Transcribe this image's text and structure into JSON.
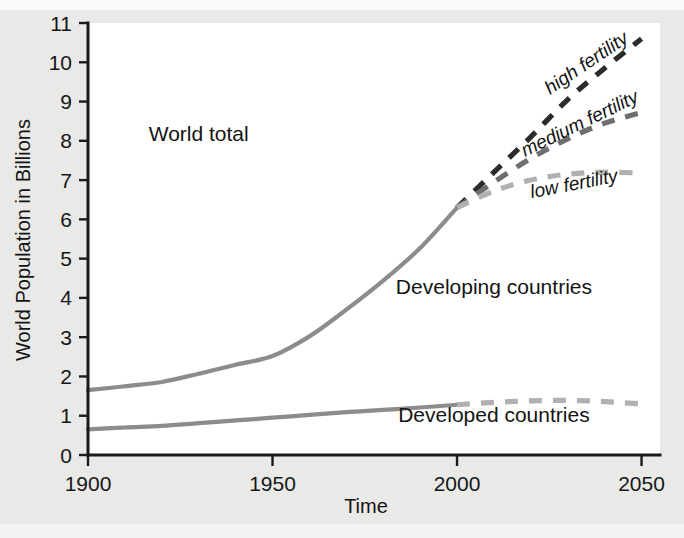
{
  "chart_data": {
    "type": "line",
    "title": "",
    "xlabel": "Time",
    "ylabel": "World Population in Billions",
    "xlim": [
      1900,
      2055
    ],
    "ylim": [
      0,
      11
    ],
    "xticks": [
      1900,
      1950,
      2000,
      2050
    ],
    "xtick_labels": [
      "1900",
      "1950",
      "2000",
      "2050"
    ],
    "yticks": [
      0,
      1,
      2,
      3,
      4,
      5,
      6,
      7,
      8,
      9,
      10,
      11
    ],
    "ytick_labels": [
      "0",
      "1",
      "2",
      "3",
      "4",
      "5",
      "6",
      "7",
      "8",
      "9",
      "10",
      "11"
    ],
    "grid": false,
    "legend_position": "inline-annotations",
    "colors": {
      "world_total": "#8c8c8c",
      "developed": "#8c8c8c",
      "high_fertility": "#2b2b2b",
      "medium_fertility": "#6e6e6e",
      "low_fertility": "#b0b0b0",
      "axis": "#1a1a1a",
      "plot_background": "#ffffff",
      "page_background": "#e9e9e7"
    },
    "series": [
      {
        "name": "World total",
        "style": "solid",
        "color": "#8c8c8c",
        "x": [
          1900,
          1910,
          1920,
          1930,
          1940,
          1950,
          1960,
          1970,
          1980,
          1990,
          2000
        ],
        "values": [
          1.65,
          1.75,
          1.86,
          2.07,
          2.3,
          2.52,
          3.02,
          3.7,
          4.44,
          5.27,
          6.3
        ]
      },
      {
        "name": "Developed countries",
        "style": "solid",
        "color": "#8c8c8c",
        "x": [
          1900,
          1910,
          1920,
          1930,
          1940,
          1950,
          1960,
          1970,
          1980,
          1990,
          2000
        ],
        "values": [
          0.65,
          0.7,
          0.74,
          0.81,
          0.88,
          0.95,
          1.02,
          1.09,
          1.15,
          1.21,
          1.28
        ]
      },
      {
        "name": "high fertility",
        "style": "dashed",
        "color": "#2b2b2b",
        "x": [
          2000,
          2010,
          2020,
          2030,
          2040,
          2050
        ],
        "values": [
          6.3,
          7.2,
          8.1,
          9.05,
          9.85,
          10.6
        ]
      },
      {
        "name": "medium fertility",
        "style": "dashed",
        "color": "#6e6e6e",
        "x": [
          2000,
          2010,
          2020,
          2030,
          2040,
          2050
        ],
        "values": [
          6.3,
          6.95,
          7.55,
          8.05,
          8.45,
          8.72
        ]
      },
      {
        "name": "low fertility",
        "style": "dashed",
        "color": "#b0b0b0",
        "x": [
          2000,
          2010,
          2020,
          2030,
          2040,
          2050
        ],
        "values": [
          6.3,
          6.72,
          7.0,
          7.15,
          7.2,
          7.18
        ]
      },
      {
        "name": "Developed countries projection",
        "style": "dashed",
        "color": "#b0b0b0",
        "x": [
          2000,
          2010,
          2020,
          2030,
          2040,
          2050
        ],
        "values": [
          1.28,
          1.34,
          1.38,
          1.39,
          1.36,
          1.3
        ]
      }
    ],
    "annotations": [
      {
        "text": "World total",
        "x": 1930,
        "y": 8.0,
        "style": "upright"
      },
      {
        "text": "Developing countries",
        "x": 2010,
        "y": 4.1,
        "style": "upright"
      },
      {
        "text": "Developed countries",
        "x": 2010,
        "y": 0.85,
        "style": "upright"
      },
      {
        "text": "high fertility",
        "x": 2036,
        "y": 9.85,
        "style": "italic-rotated"
      },
      {
        "text": "medium fertility",
        "x": 2034,
        "y": 8.3,
        "style": "italic-rotated"
      },
      {
        "text": "low fertility",
        "x": 2032,
        "y": 6.75,
        "style": "italic-rotated"
      }
    ]
  }
}
